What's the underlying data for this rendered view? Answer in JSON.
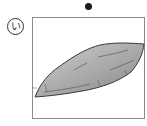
{
  "marker": {
    "dot": "bullet-dot"
  },
  "option": {
    "label": "い",
    "label_style": "circled-hiragana"
  },
  "illustration": {
    "subject": "sweet-potato",
    "fill_light": "#c8c8c8",
    "fill_dark": "#8c8c8c",
    "stroke": "#3a3a3a",
    "frame_color": "#8a8a8a"
  }
}
